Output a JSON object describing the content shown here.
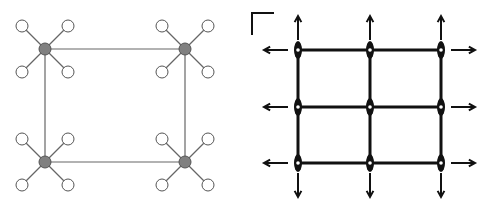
{
  "figure": {
    "width": 491,
    "height": 213,
    "background": "#ffffff"
  },
  "left_diagram": {
    "description": "Four hub nodes connected in a rectangle, each hub with four leaf nodes",
    "hub_color": "#808080",
    "hub_stroke": "#555555",
    "leaf_fill": "#ffffff",
    "leaf_stroke": "#555555",
    "edge_color": "#666666",
    "hub_radius": 6,
    "leaf_radius": 6,
    "leaf_offset": 23,
    "hubs": [
      {
        "id": "hub-top-left",
        "x": 45,
        "y": 49
      },
      {
        "id": "hub-top-right",
        "x": 185,
        "y": 49
      },
      {
        "id": "hub-bottom-left",
        "x": 45,
        "y": 162
      },
      {
        "id": "hub-bottom-right",
        "x": 185,
        "y": 162
      }
    ],
    "edges": [
      [
        "hub-top-left",
        "hub-top-right"
      ],
      [
        "hub-top-right",
        "hub-bottom-right"
      ],
      [
        "hub-bottom-right",
        "hub-bottom-left"
      ],
      [
        "hub-bottom-left",
        "hub-top-left"
      ]
    ]
  },
  "right_diagram": {
    "description": "3x3 grid mesh with outward-pointing arrows at the boundary",
    "line_color": "#111111",
    "columns_x": [
      298,
      370,
      441
    ],
    "rows_y": [
      50,
      107,
      163
    ],
    "node_rx": 4,
    "node_ry": 9,
    "corner_mark": {
      "x": 252,
      "y": 13,
      "len": 22
    },
    "arrow_length": 24,
    "arrow_gap": 10
  }
}
